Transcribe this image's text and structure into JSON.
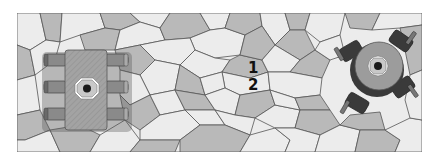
{
  "figure": {
    "colors": {
      "background": "#ffffff",
      "tile_light": "#ececec",
      "tile_dark": "#b9b9b9",
      "tile_edge": "#555555",
      "gripper_body": "#9c9c9c",
      "gripper_dark": "#3a3a3a",
      "finger": "#8a8a8a"
    },
    "labels": [
      {
        "id": "label-1",
        "text": "1",
        "x": 252,
        "y": 72
      },
      {
        "id": "label-2",
        "text": "2",
        "x": 252,
        "y": 89
      }
    ],
    "objects": [
      {
        "id": "rect-gripper",
        "type": "rectangular gripper with 6 fingers",
        "cx": 87,
        "cy": 86
      },
      {
        "id": "round-gripper",
        "type": "round gripper with 4 fingers",
        "cx": 377,
        "cy": 68
      }
    ]
  }
}
